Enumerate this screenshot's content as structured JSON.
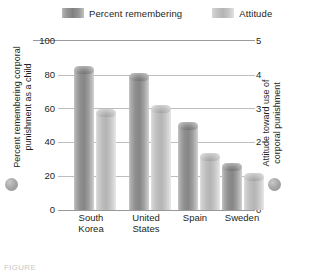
{
  "chart_data": {
    "type": "bar",
    "title": "",
    "categories": [
      "South Korea",
      "United States",
      "Spain",
      "Sweden"
    ],
    "series": [
      {
        "name": "Percent remembering",
        "axis": "left",
        "color": "#8e8e8e",
        "values": [
          85,
          81,
          52,
          28
        ]
      },
      {
        "name": "Attitude",
        "axis": "right",
        "color": "#bcbcbc",
        "values": [
          3.0,
          3.1,
          1.7,
          1.1
        ]
      }
    ],
    "xlabel": "",
    "ylabel": "Percent remembering corporal punishment as a child",
    "y2label": "Attitude toward use of corporal punishment",
    "ylim": [
      0,
      100
    ],
    "y2lim": [
      0,
      5
    ],
    "yticks": [
      "0",
      "20",
      "40",
      "60",
      "80",
      "100"
    ],
    "y2ticks": [
      "0",
      "1",
      "2",
      "3",
      "4",
      "5"
    ],
    "grid": true,
    "legend_position": "top"
  },
  "legend": {
    "items": [
      {
        "label": "Percent remembering",
        "swatch": "dark-gray-gradient"
      },
      {
        "label": "Attitude",
        "swatch": "light-gray-gradient"
      }
    ]
  },
  "axes": {
    "left": {
      "title": "Percent remembering corporal punishment as a child",
      "ticks": [
        "100",
        "80",
        "60",
        "40",
        "20",
        "0"
      ],
      "marker": "gray-circle"
    },
    "right": {
      "title": "Attitude toward use of corporal punishment",
      "ticks": [
        "5",
        "4",
        "3",
        "2",
        "1",
        "0"
      ],
      "marker": "gray-circle"
    }
  },
  "categories": [
    {
      "line1": "South",
      "line2": "Korea"
    },
    {
      "line1": "United",
      "line2": "States"
    },
    {
      "line1": "Spain",
      "line2": ""
    },
    {
      "line1": "Sweden",
      "line2": ""
    }
  ],
  "caption": "FIGURE"
}
